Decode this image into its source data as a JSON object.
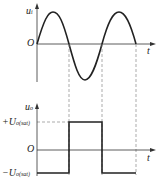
{
  "top_plot": {
    "y_axis_label": "u",
    "y_axis_sub": "i",
    "origin_label": "O",
    "x_axis_label": "t",
    "waveform": "sine"
  },
  "bottom_plot": {
    "y_axis_label": "u",
    "y_axis_sub": "o",
    "pos_level_label": "+U",
    "pos_level_sub": "o(sat)",
    "neg_level_label": "−U",
    "neg_level_sub": "o(sat)",
    "origin_label": "O",
    "x_axis_label": "t",
    "waveform": "square"
  },
  "colors": {
    "line": "#222222",
    "dash": "#888888"
  }
}
